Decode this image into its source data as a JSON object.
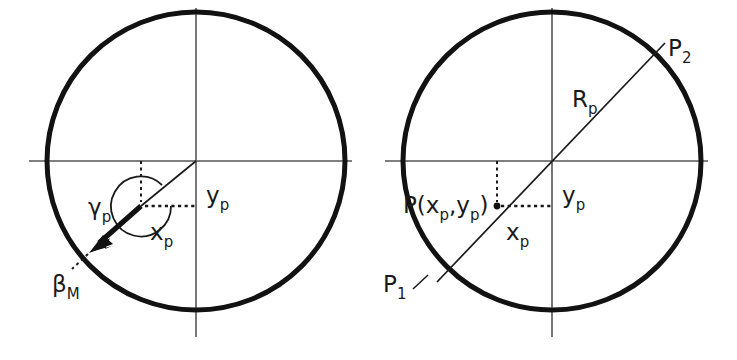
{
  "figure": {
    "title": "",
    "background_color": "#ffffff",
    "stroke_color": "#1a1a1a",
    "axis_color": "#4a4a4a",
    "width": 737,
    "height": 360
  },
  "panels": [
    {
      "id": "left-panel",
      "name": "angle-definition-diagram",
      "circle": {
        "cx": 196,
        "cy": 161,
        "r": 149
      },
      "axes": {
        "horizontal": {
          "x1": 29,
          "y1": 161,
          "x2": 352,
          "y2": 161
        },
        "vertical": {
          "x1": 196,
          "y1": 8,
          "x2": 196,
          "y2": 337
        }
      },
      "point_p": {
        "x": 141,
        "y": 206
      },
      "arrow_tip": {
        "x": 92,
        "y": 250
      },
      "beta_dash_end": {
        "x": 74,
        "y": 268
      },
      "labels": [
        {
          "name": "gamma-p-label",
          "base": "γ",
          "sub": "p",
          "x": 95,
          "y": 213
        },
        {
          "name": "beta-m-label",
          "base": "β",
          "sub": "M",
          "x": 56,
          "y": 288
        },
        {
          "name": "y-p-label",
          "base": "y",
          "sub": "p",
          "x": 207,
          "y": 202
        },
        {
          "name": "x-p-label",
          "base": "x",
          "sub": "p",
          "x": 152,
          "y": 241
        }
      ]
    },
    {
      "id": "right-panel",
      "name": "chord-radius-diagram",
      "circle": {
        "cx": 552,
        "cy": 161,
        "r": 149
      },
      "axes": {
        "horizontal": {
          "x1": 385,
          "y1": 161,
          "x2": 708,
          "y2": 161
        },
        "vertical": {
          "x1": 552,
          "y1": 8,
          "x2": 552,
          "y2": 337
        }
      },
      "point_p": {
        "x": 497,
        "y": 206
      },
      "chord": {
        "x1": 443,
        "y1": 276,
        "x2": 661,
        "y2": 47
      },
      "labels": [
        {
          "name": "p-coordinates-label",
          "base": "P(x",
          "sub": "p",
          "mid": ",y",
          "sub2": "p",
          "tail": ")",
          "x": 407,
          "y": 212
        },
        {
          "name": "r-p-label",
          "base": "R",
          "sub": "p",
          "x": 578,
          "y": 104
        },
        {
          "name": "p2-label",
          "base": "P",
          "sub": "2",
          "x": 671,
          "y": 53
        },
        {
          "name": "p1-label",
          "base": "P",
          "sub": "1",
          "x": 389,
          "y": 289
        },
        {
          "name": "y-p-label-right",
          "base": "y",
          "sub": "p",
          "x": 563,
          "y": 202
        },
        {
          "name": "x-p-label-right",
          "base": "x",
          "sub": "p",
          "x": 508,
          "y": 241
        }
      ]
    }
  ],
  "symbols": {
    "gamma": "γ",
    "beta": "β",
    "sub_p": "p",
    "sub_M": "M",
    "sub_1": "1",
    "sub_2": "2",
    "x": "x",
    "y": "y",
    "R": "R",
    "P": "P",
    "open_paren": "(",
    "close_paren": ")",
    "comma": ","
  }
}
